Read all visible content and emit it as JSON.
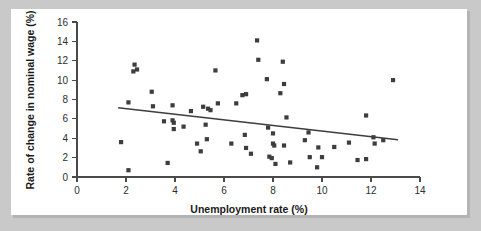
{
  "figure": {
    "background_color": "#c9c9c9",
    "panel_color": "#ffffff",
    "marker_color": "#3d3d3d",
    "axis_color": "#4a4a4a",
    "trend_color": "#3d3d3d"
  },
  "chart_data": {
    "type": "scatter",
    "title": "",
    "xlabel": "Unemployment rate (%)",
    "ylabel": "Rate of change in nominal wage (%)",
    "xlim": [
      0,
      14
    ],
    "ylim": [
      0,
      16
    ],
    "xticks": [
      0,
      2,
      4,
      6,
      8,
      10,
      12,
      14
    ],
    "yticks": [
      0,
      2,
      4,
      6,
      8,
      10,
      12,
      14,
      16
    ],
    "xtick_labels": [
      "0",
      "2",
      "4",
      "6",
      "8",
      "10",
      "12",
      "14"
    ],
    "ytick_labels": [
      "0",
      "2",
      "4",
      "6",
      "8",
      "10",
      "12",
      "14",
      "16"
    ],
    "grid": false,
    "legend": null,
    "marker_shape": "square",
    "marker_size": 4.2,
    "points": [
      [
        1.8,
        3.6
      ],
      [
        2.1,
        7.7
      ],
      [
        2.1,
        0.7
      ],
      [
        2.35,
        11.6
      ],
      [
        2.45,
        11.1
      ],
      [
        2.3,
        10.9
      ],
      [
        3.05,
        8.8
      ],
      [
        3.1,
        7.3
      ],
      [
        3.55,
        5.75
      ],
      [
        3.7,
        1.45
      ],
      [
        3.9,
        7.4
      ],
      [
        3.9,
        5.85
      ],
      [
        3.95,
        5.6
      ],
      [
        3.95,
        4.95
      ],
      [
        4.35,
        5.2
      ],
      [
        4.65,
        6.8
      ],
      [
        4.9,
        3.45
      ],
      [
        5.05,
        2.65
      ],
      [
        5.15,
        7.25
      ],
      [
        5.25,
        5.4
      ],
      [
        5.3,
        3.9
      ],
      [
        5.35,
        7.05
      ],
      [
        5.45,
        6.9
      ],
      [
        5.65,
        11.0
      ],
      [
        5.75,
        7.6
      ],
      [
        6.3,
        3.45
      ],
      [
        6.5,
        7.6
      ],
      [
        6.75,
        8.45
      ],
      [
        6.85,
        4.35
      ],
      [
        6.9,
        8.55
      ],
      [
        6.9,
        3.0
      ],
      [
        7.1,
        2.4
      ],
      [
        7.35,
        14.1
      ],
      [
        7.4,
        12.1
      ],
      [
        7.75,
        10.1
      ],
      [
        7.8,
        5.1
      ],
      [
        7.85,
        2.1
      ],
      [
        7.95,
        1.95
      ],
      [
        8.0,
        4.5
      ],
      [
        8.0,
        3.45
      ],
      [
        8.05,
        3.25
      ],
      [
        8.1,
        1.35
      ],
      [
        8.3,
        8.65
      ],
      [
        8.4,
        11.9
      ],
      [
        8.45,
        9.6
      ],
      [
        8.45,
        3.25
      ],
      [
        8.55,
        6.15
      ],
      [
        8.7,
        1.5
      ],
      [
        9.3,
        3.8
      ],
      [
        9.45,
        4.6
      ],
      [
        9.5,
        2.05
      ],
      [
        9.8,
        1.0
      ],
      [
        9.85,
        3.05
      ],
      [
        10.0,
        2.05
      ],
      [
        10.5,
        3.1
      ],
      [
        11.1,
        3.55
      ],
      [
        11.45,
        1.75
      ],
      [
        11.8,
        6.35
      ],
      [
        11.8,
        1.85
      ],
      [
        12.1,
        4.1
      ],
      [
        12.15,
        3.45
      ],
      [
        12.5,
        3.8
      ],
      [
        12.9,
        10.0
      ]
    ],
    "trendline": {
      "type": "linear",
      "x_start": 1.68,
      "y_start": 7.15,
      "x_end": 13.1,
      "y_end": 3.85
    }
  }
}
